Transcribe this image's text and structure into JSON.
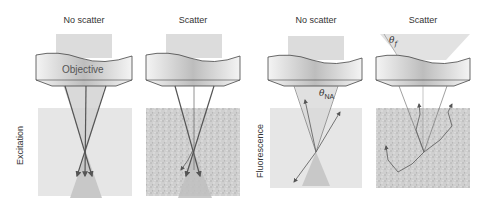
{
  "columns": [
    {
      "id": "exc-no-scatter",
      "title": "No scatter"
    },
    {
      "id": "exc-scatter",
      "title": "Scatter"
    },
    {
      "id": "flu-no-scatter",
      "title": "No scatter"
    },
    {
      "id": "flu-scatter",
      "title": "Scatter"
    }
  ],
  "rows": {
    "excitation": "Excitation",
    "fluorescence": "Fluorescence"
  },
  "objective_label": "Objective",
  "angles": {
    "theta_na_symbol": "θ",
    "theta_na_sub": "NA",
    "theta_f_symbol": "θ",
    "theta_f_sub": "f"
  },
  "colors": {
    "beam": "#d4d4d4",
    "sample_clear": "#e6e6e6",
    "sample_scatter": "#c8c8c8",
    "ray": "#555555",
    "lens_edge": "#444444"
  }
}
